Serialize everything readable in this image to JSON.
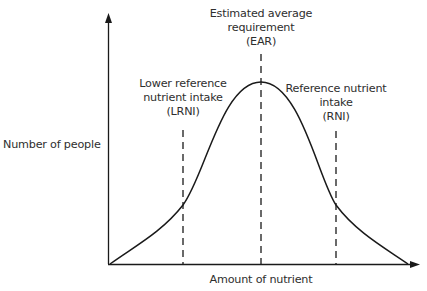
{
  "diagram": {
    "type": "normal-distribution",
    "y_axis_label": "Number of people",
    "x_axis_label": "Amount of nutrient",
    "markers": [
      {
        "id": "lrni",
        "lines": [
          "Lower reference",
          "nutrient intake",
          "(LRNI)"
        ],
        "position": "mean - 2 SD"
      },
      {
        "id": "ear",
        "lines": [
          "Estimated average",
          "requirement",
          "(EAR)"
        ],
        "position": "mean"
      },
      {
        "id": "rni",
        "lines": [
          "Reference nutrient",
          "intake",
          "(RNI)"
        ],
        "position": "mean + 2 SD"
      }
    ],
    "colors": {
      "line": "#1a1a1a",
      "text": "#2e2e2e",
      "background": "#ffffff"
    }
  }
}
